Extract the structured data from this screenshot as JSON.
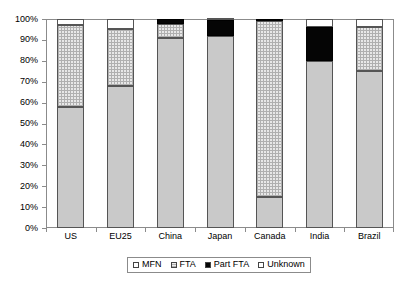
{
  "chart_data": {
    "type": "bar",
    "subtype": "stacked-100-percent",
    "title": "",
    "xlabel": "",
    "ylabel": "",
    "ylim": [
      0,
      100
    ],
    "ytick_labels": [
      "0%",
      "10%",
      "20%",
      "30%",
      "40%",
      "50%",
      "60%",
      "70%",
      "80%",
      "90%",
      "100%"
    ],
    "ytick_values": [
      0,
      10,
      20,
      30,
      40,
      50,
      60,
      70,
      80,
      90,
      100
    ],
    "grid": false,
    "legend_position": "bottom",
    "categories": [
      "US",
      "EU25",
      "China",
      "Japan",
      "Canada",
      "India",
      "Brazil"
    ],
    "series": [
      {
        "name": "MFN",
        "values": [
          58,
          68,
          91,
          92,
          15,
          80,
          75
        ]
      },
      {
        "name": "FTA",
        "values": [
          39,
          27,
          6.5,
          0,
          84,
          0,
          21
        ]
      },
      {
        "name": "Part FTA",
        "values": [
          0,
          0,
          2.5,
          7.5,
          1,
          16,
          0
        ]
      },
      {
        "name": "Unknown",
        "values": [
          3,
          5,
          0,
          0.5,
          0,
          4,
          4
        ]
      }
    ]
  },
  "legend": {
    "items": [
      {
        "label": "MFN",
        "swatch": "mfn"
      },
      {
        "label": "FTA",
        "swatch": "fta"
      },
      {
        "label": "Part FTA",
        "swatch": "partfta"
      },
      {
        "label": "Unknown",
        "swatch": "unknown"
      }
    ]
  },
  "colors": {
    "mfn": "#c9c9c9",
    "fta": "#e8e8e8",
    "part_fta": "#050505",
    "unknown": "#ffffff",
    "axis": "#8b8b8b",
    "outline": "#555555"
  }
}
